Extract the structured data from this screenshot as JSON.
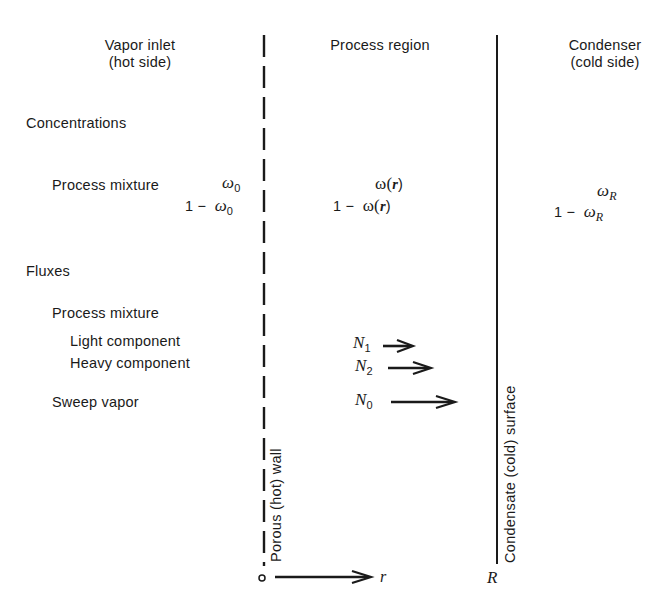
{
  "headers": {
    "left": {
      "line1": "Vapor inlet",
      "line2": "(hot side)"
    },
    "middle": {
      "line1": "Process region"
    },
    "right": {
      "line1": "Condenser",
      "line2": "(cold side)"
    }
  },
  "sections": {
    "concentrations": "Concentrations",
    "fluxes": "Fluxes"
  },
  "concentrations": {
    "label": "Process mixture",
    "inlet": {
      "omega": "ω",
      "omega_sub": "0",
      "one_minus": "1 −"
    },
    "process": {
      "omega": "ω(",
      "r": "r",
      "close": ")",
      "one_minus": "1 −"
    },
    "condenser": {
      "omega": "ω",
      "omega_sub": "R",
      "one_minus": "1 −"
    }
  },
  "fluxes": {
    "process_mixture": "Process mixture",
    "light_component": "Light component",
    "heavy_component": "Heavy component",
    "sweep_vapor": "Sweep vapor",
    "N1": {
      "symbol": "N",
      "sub": "1"
    },
    "N2": {
      "symbol": "N",
      "sub": "2"
    },
    "N0": {
      "symbol": "N",
      "sub": "0"
    }
  },
  "walls": {
    "porous_wall": "Porous (hot) wall",
    "condensate_surface": "Condensate (cold) surface"
  },
  "axis": {
    "origin": "o",
    "variable": "r",
    "end": "R"
  },
  "colors": {
    "ink": "#1a1a1a",
    "background": "#ffffff"
  }
}
